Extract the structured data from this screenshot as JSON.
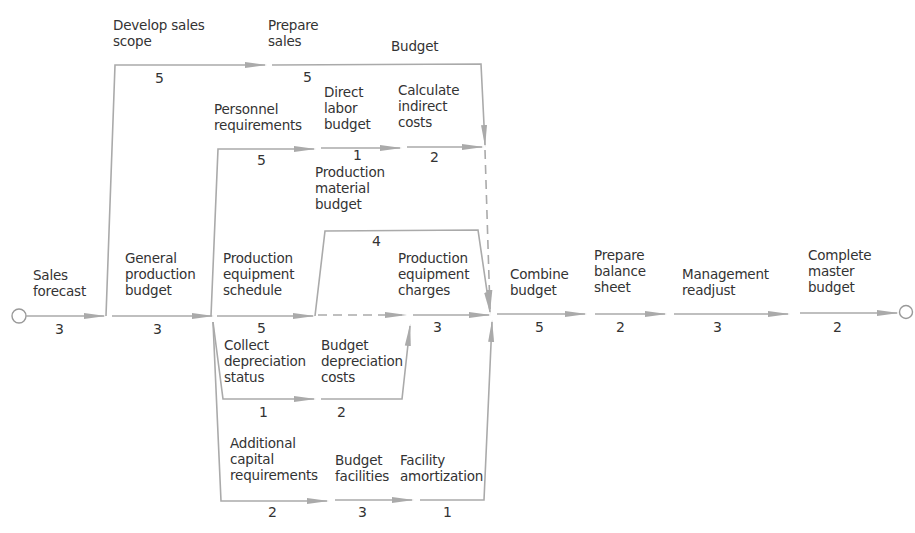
{
  "diagram": {
    "type": "PERT network",
    "nodes": {
      "start": "start-node",
      "end": "end-node"
    },
    "activities": [
      {
        "id": "sales_forecast",
        "label": "Sales\nforecast",
        "duration": "3"
      },
      {
        "id": "develop_sales_scope",
        "label": "Develop sales\nscope",
        "duration": "5"
      },
      {
        "id": "prepare_sales_budget",
        "label": "Prepare\nsales",
        "label2": "Budget",
        "duration": "5"
      },
      {
        "id": "general_production_budget",
        "label": "General\nproduction\nbudget",
        "duration": "3"
      },
      {
        "id": "personnel_requirements",
        "label": "Personnel\nrequirements",
        "duration": "5"
      },
      {
        "id": "direct_labor_budget",
        "label": "Direct\nlabor\nbudget",
        "duration": "1"
      },
      {
        "id": "calculate_indirect_costs",
        "label": "Calculate\nindirect\ncosts",
        "duration": "2"
      },
      {
        "id": "production_material_budget",
        "label": "Production\nmaterial\nbudget",
        "duration": "4"
      },
      {
        "id": "production_equipment_schedule",
        "label": "Production\nequipment\nschedule",
        "duration": "5"
      },
      {
        "id": "production_equipment_charges",
        "label": "Production\nequipment\ncharges",
        "duration": "3"
      },
      {
        "id": "collect_depreciation_status",
        "label": "Collect\ndepreciation\nstatus",
        "duration": "1"
      },
      {
        "id": "budget_depreciation_costs",
        "label": "Budget\ndepreciation\ncosts",
        "duration": "2"
      },
      {
        "id": "additional_capital_requirements",
        "label": "Additional\ncapital\nrequirements",
        "duration": "2"
      },
      {
        "id": "budget_facilities",
        "label": "Budget\nfacilities",
        "duration": "3"
      },
      {
        "id": "facility_amortization",
        "label": "Facility\namortization",
        "duration": "1"
      },
      {
        "id": "combine_budget",
        "label": "Combine\nbudget",
        "duration": "5"
      },
      {
        "id": "prepare_balance_sheet",
        "label": "Prepare\nbalance\nsheet",
        "duration": "2"
      },
      {
        "id": "management_readjust",
        "label": "Management\nreadjust",
        "duration": "3"
      },
      {
        "id": "complete_master_budget",
        "label": "Complete\nmaster\nbudget",
        "duration": "2"
      }
    ],
    "colors": {
      "line": "#aaaaaa",
      "text": "#333333",
      "background": "#ffffff"
    }
  }
}
